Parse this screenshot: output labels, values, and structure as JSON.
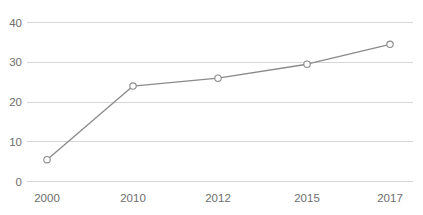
{
  "chart_data": {
    "type": "line",
    "title": "",
    "subtitle": "",
    "xlabel": "",
    "ylabel": "",
    "categories": [
      "2000",
      "2010",
      "2012",
      "2015",
      "2017"
    ],
    "values": [
      5.5,
      24,
      26,
      29.5,
      34.5
    ],
    "series": [
      {
        "name": "",
        "values": [
          5.5,
          24,
          26,
          29.5,
          34.5
        ]
      }
    ],
    "ylim": [
      0,
      40
    ],
    "yticks": [
      0,
      10,
      20,
      30,
      40
    ],
    "ytick_labels": [
      "0",
      "10",
      "20",
      "30",
      "40"
    ],
    "xtick_labels": [
      "2000",
      "2010",
      "2012",
      "2015",
      "2017"
    ],
    "grid": "horizontal",
    "legend": "none",
    "annotations": [],
    "colors": {
      "line": "#8a8a8a",
      "marker_fill": "#ffffff",
      "marker_stroke": "#8a8a8a",
      "gridline": "#d6d6d6",
      "tick_label": "#6e6e6e",
      "background": "#ffffff"
    },
    "marker_style": "open-circle"
  },
  "axes": {
    "y": {
      "ticks": [
        {
          "label": "40",
          "value": 40
        },
        {
          "label": "30",
          "value": 30
        },
        {
          "label": "20",
          "value": 20
        },
        {
          "label": "10",
          "value": 10
        },
        {
          "label": "0",
          "value": 0
        }
      ]
    },
    "x": {
      "ticks": [
        {
          "label": "2000"
        },
        {
          "label": "2010"
        },
        {
          "label": "2012"
        },
        {
          "label": "2015"
        },
        {
          "label": "2017"
        }
      ]
    }
  }
}
